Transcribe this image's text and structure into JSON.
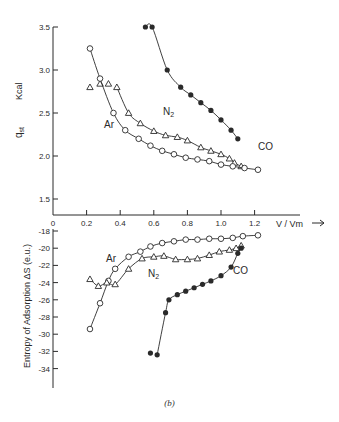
{
  "caption": "(b)",
  "chart_data": [
    {
      "type": "scatter",
      "title": "",
      "xlabel": "V / Vm →",
      "ylabel": "q_st  Kcal",
      "xlim": [
        0,
        1.3
      ],
      "ylim": [
        1.5,
        3.5
      ],
      "x_ticks": [
        "0",
        "0.2",
        "0.4",
        "0.6",
        "0.8",
        "1.0",
        "1.2"
      ],
      "y_ticks": [
        "1.5",
        "2.0",
        "2.5",
        "3.0",
        "3.5"
      ],
      "grid": false,
      "legend": "inline labels",
      "series": [
        {
          "name": "CO",
          "marker": "filled-circle",
          "x": [
            0.55,
            0.59,
            0.68,
            0.76,
            0.82,
            0.88,
            0.94,
            1.0,
            1.06,
            1.1
          ],
          "y": [
            3.5,
            3.5,
            3.0,
            2.8,
            2.71,
            2.62,
            2.53,
            2.42,
            2.3,
            2.2
          ]
        },
        {
          "name": "N2",
          "marker": "triangle",
          "x": [
            0.22,
            0.28,
            0.33,
            0.38,
            0.45,
            0.52,
            0.6,
            0.67,
            0.74,
            0.8,
            0.88,
            0.94,
            1.0,
            1.05,
            1.08,
            1.12
          ],
          "y": [
            2.8,
            2.84,
            2.84,
            2.8,
            2.5,
            2.38,
            2.29,
            2.24,
            2.22,
            2.18,
            2.1,
            2.06,
            2.02,
            1.97,
            1.92,
            1.88
          ]
        },
        {
          "name": "Ar",
          "marker": "open-circle",
          "x": [
            0.22,
            0.28,
            0.36,
            0.43,
            0.51,
            0.58,
            0.65,
            0.72,
            0.79,
            0.86,
            0.93,
            1.0,
            1.07,
            1.14,
            1.22
          ],
          "y": [
            3.25,
            2.9,
            2.5,
            2.3,
            2.2,
            2.12,
            2.06,
            2.02,
            1.98,
            1.96,
            1.94,
            1.9,
            1.88,
            1.86,
            1.84
          ]
        }
      ]
    },
    {
      "type": "scatter",
      "title": "",
      "xlabel": "V / Vm",
      "ylabel": "Entropy of Adsorption ΔS (e.u.)",
      "xlim": [
        0,
        1.3
      ],
      "ylim": [
        -36,
        -18
      ],
      "y_ticks": [
        "-18",
        "-20",
        "-22",
        "-24",
        "-26",
        "-28",
        "-30",
        "-32",
        "-34"
      ],
      "grid": false,
      "legend": "inline labels",
      "series": [
        {
          "name": "Ar",
          "marker": "open-circle",
          "x": [
            0.22,
            0.28,
            0.33,
            0.37,
            0.45,
            0.52,
            0.58,
            0.65,
            0.72,
            0.79,
            0.86,
            0.93,
            1.0,
            1.07,
            1.13,
            1.22
          ],
          "y": [
            -29.4,
            -26.4,
            -23.8,
            -22.4,
            -21.0,
            -20.4,
            -19.8,
            -19.4,
            -19.2,
            -19.0,
            -19.0,
            -18.9,
            -18.9,
            -18.8,
            -18.6,
            -18.5
          ]
        },
        {
          "name": "N2",
          "marker": "triangle",
          "x": [
            0.22,
            0.27,
            0.32,
            0.37,
            0.45,
            0.53,
            0.6,
            0.66,
            0.73,
            0.8,
            0.86,
            0.93,
            0.99,
            1.05,
            1.09,
            1.12
          ],
          "y": [
            -23.6,
            -24.4,
            -24.0,
            -24.2,
            -22.4,
            -21.2,
            -21.0,
            -20.9,
            -21.3,
            -21.3,
            -21.2,
            -20.8,
            -20.4,
            -20.2,
            -20.0,
            -19.7
          ]
        },
        {
          "name": "CO",
          "marker": "filled-circle",
          "x": [
            0.58,
            0.62,
            0.67,
            0.69,
            0.74,
            0.79,
            0.84,
            0.89,
            0.94,
            1.0,
            1.06,
            1.1,
            1.12
          ],
          "y": [
            -32.2,
            -32.4,
            -27.5,
            -26.0,
            -25.4,
            -25.0,
            -24.6,
            -24.2,
            -23.8,
            -23.2,
            -22.2,
            -20.6,
            -20.0
          ]
        }
      ]
    }
  ]
}
